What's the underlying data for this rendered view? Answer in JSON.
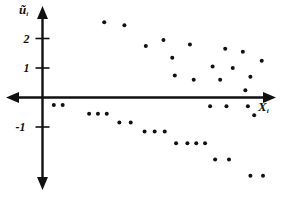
{
  "figure": {
    "title": "",
    "background_color": "#ffffff",
    "ink_color": "#111111"
  },
  "axes": {
    "y_axis": {
      "label": "ũ",
      "subscript": "i",
      "name": "residual-axis"
    },
    "x_axis": {
      "label": "X",
      "subscript": "i",
      "name": "predictor-axis"
    },
    "y_ticks": [
      {
        "label": "2",
        "value": 2
      },
      {
        "label": "1",
        "value": 1
      },
      {
        "label": "-1",
        "value": -1
      }
    ]
  },
  "chart_data": {
    "type": "scatter",
    "title": "",
    "subtitle": "",
    "xlabel": "Xᵢ",
    "ylabel": "ũᵢ",
    "grid": false,
    "legend": null,
    "xlim": [
      0,
      10
    ],
    "ylim": [
      -3.2,
      2.9
    ],
    "y_tick_values": [
      2,
      1,
      -1
    ],
    "y_tick_labels": [
      "2",
      "1",
      "-1"
    ],
    "x_tick_values": [],
    "x_tick_labels": [],
    "marker": "filled-circle",
    "marker_color": "#111111",
    "marker_size_px": 4,
    "point_count": 43,
    "points": [
      {
        "x": 2.45,
        "y": 2.55
      },
      {
        "x": 3.25,
        "y": 2.45
      },
      {
        "x": 4.1,
        "y": 1.75
      },
      {
        "x": 4.8,
        "y": 1.95
      },
      {
        "x": 5.15,
        "y": 1.35
      },
      {
        "x": 5.25,
        "y": 0.75
      },
      {
        "x": 5.85,
        "y": 1.8
      },
      {
        "x": 6.0,
        "y": 0.6
      },
      {
        "x": 6.75,
        "y": 1.05
      },
      {
        "x": 7.05,
        "y": 0.6
      },
      {
        "x": 7.25,
        "y": 1.65
      },
      {
        "x": 7.55,
        "y": 1.0
      },
      {
        "x": 7.95,
        "y": 1.55
      },
      {
        "x": 8.05,
        "y": 0.25
      },
      {
        "x": 8.25,
        "y": 0.7
      },
      {
        "x": 8.7,
        "y": 1.25
      },
      {
        "x": 0.45,
        "y": -0.25
      },
      {
        "x": 0.8,
        "y": -0.25
      },
      {
        "x": 1.85,
        "y": -0.55
      },
      {
        "x": 2.2,
        "y": -0.55
      },
      {
        "x": 2.55,
        "y": -0.55
      },
      {
        "x": 3.05,
        "y": -0.85
      },
      {
        "x": 3.5,
        "y": -0.85
      },
      {
        "x": 4.05,
        "y": -1.15
      },
      {
        "x": 4.45,
        "y": -1.15
      },
      {
        "x": 4.85,
        "y": -1.15
      },
      {
        "x": 5.3,
        "y": -1.55
      },
      {
        "x": 5.75,
        "y": -1.55
      },
      {
        "x": 6.1,
        "y": -1.55
      },
      {
        "x": 6.45,
        "y": -1.55
      },
      {
        "x": 6.65,
        "y": -0.3
      },
      {
        "x": 7.3,
        "y": -0.3
      },
      {
        "x": 6.85,
        "y": -2.1
      },
      {
        "x": 7.4,
        "y": -2.1
      },
      {
        "x": 8.15,
        "y": -0.3
      },
      {
        "x": 8.4,
        "y": -0.6
      },
      {
        "x": 8.25,
        "y": -2.65
      },
      {
        "x": 8.75,
        "y": -2.65
      }
    ]
  }
}
